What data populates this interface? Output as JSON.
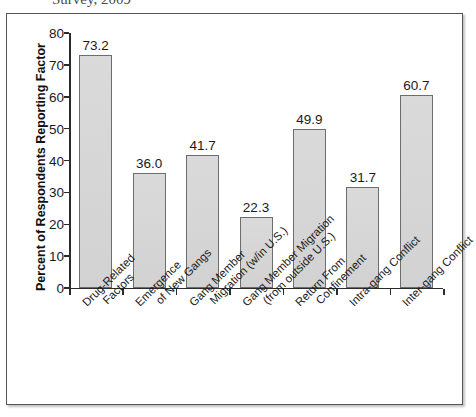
{
  "caption": {
    "text": "Survey, 2009"
  },
  "chart_data": {
    "type": "bar",
    "title": "",
    "xlabel": "",
    "ylabel": "Percent of Respondents Reporting Factor",
    "ylim": [
      0,
      80
    ],
    "ytick_labels": [
      "0",
      "10",
      "20",
      "30",
      "40",
      "50",
      "60",
      "70",
      "80"
    ],
    "yticks": [
      0,
      10,
      20,
      30,
      40,
      50,
      60,
      70,
      80
    ],
    "grid": false,
    "legend": null,
    "bar_color": "#d6d6d6",
    "bar_edge_color": "#6d6d6d",
    "categories": [
      "Drug-Related Factors",
      "Emergence of New Gangs",
      "Gang Member Migration (w/in U.S.)",
      "Gang Member Migration (from outside U.S.)",
      "Return From Confinement",
      "Intra-gang Conflict",
      "Inter-gang Conflict"
    ],
    "category_lines": [
      [
        "Drug-Related",
        "Factors"
      ],
      [
        "Emergence",
        "of New Gangs"
      ],
      [
        "Gang Member",
        "Migration (w/in U.S.)"
      ],
      [
        "Gang Member Migration",
        "(from outside U.S.)"
      ],
      [
        "Return From",
        "Confinement"
      ],
      [
        "Intra-gang Conflict",
        ""
      ],
      [
        "Inter-gang Conflict",
        ""
      ]
    ],
    "values": [
      73.2,
      36.0,
      41.7,
      22.3,
      49.9,
      31.7,
      60.7
    ],
    "value_labels": [
      "73.2",
      "36.0",
      "41.7",
      "22.3",
      "49.9",
      "31.7",
      "60.7"
    ]
  }
}
